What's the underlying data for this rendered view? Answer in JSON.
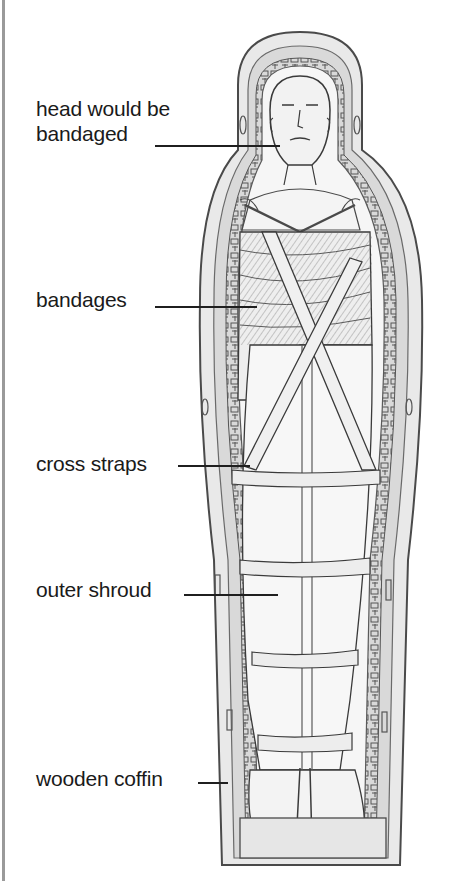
{
  "diagram": {
    "colors": {
      "background": "#ffffff",
      "text": "#1a1a1a",
      "pencil_dark": "#3a3a3a",
      "pencil_mid": "#8a8a8a",
      "pencil_light": "#d8d8d8",
      "border": "#9a9a9a"
    },
    "labels": [
      {
        "id": "head",
        "line1": "head would be",
        "line2": "bandaged"
      },
      {
        "id": "bandages",
        "text": "bandages"
      },
      {
        "id": "cross-straps",
        "text": "cross straps"
      },
      {
        "id": "outer-shroud",
        "text": "outer shroud"
      },
      {
        "id": "wooden-coffin",
        "text": "wooden coffin"
      }
    ]
  }
}
